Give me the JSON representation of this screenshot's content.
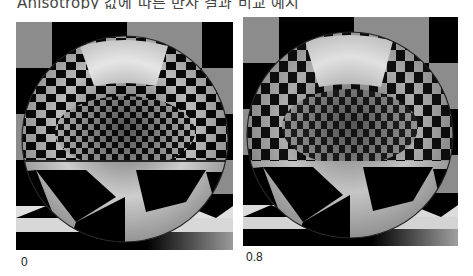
{
  "caption": "Anisotropy 값에 따른 반사 결과 비교 예시",
  "panels": [
    {
      "label": "0",
      "anisotropy": 0.0
    },
    {
      "label": "0.8",
      "anisotropy": 0.8
    }
  ],
  "colors": {
    "checker_light": "#8c8c8c",
    "checker_dark": "#000000",
    "floor_light": "#e6e6e6",
    "highlight": "#ffffff"
  }
}
